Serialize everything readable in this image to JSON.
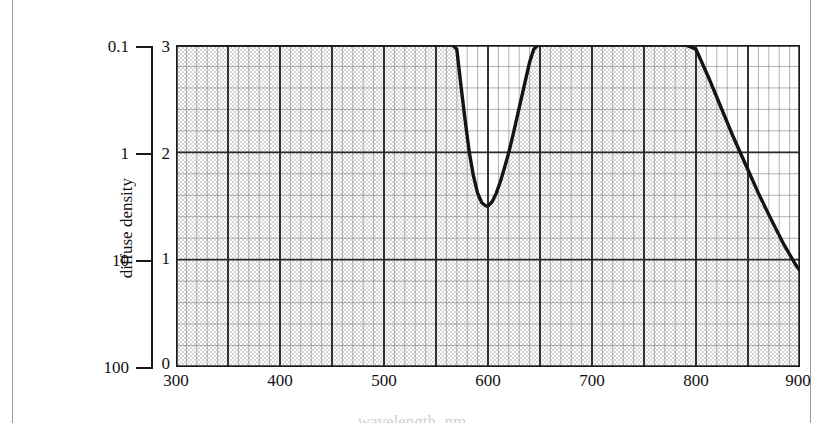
{
  "figure": {
    "background_color": "#ffffff",
    "ink_color": "#1a1a1a",
    "grid_minor_color": "#8c8c8c",
    "grid_major_color": "#262626",
    "stipple_color": "#b9b9b9"
  },
  "transmittance_axis": {
    "title": "transmittance, per cent",
    "ticks": [
      {
        "label": "0.1",
        "density": 3
      },
      {
        "label": "1",
        "density": 2
      },
      {
        "label": "10",
        "density": 1
      },
      {
        "label": "100",
        "density": 0
      }
    ]
  },
  "density_axis": {
    "title": "diffuse density",
    "ticks": [
      "3",
      "2",
      "1",
      "0"
    ]
  },
  "x_axis": {
    "title": "wavelength, nm",
    "ticks": [
      "300",
      "400",
      "500",
      "600",
      "700",
      "800",
      "900"
    ]
  },
  "chart_data": {
    "type": "line",
    "title": "",
    "subtitle": "",
    "xlabel": "wavelength, nm",
    "ylabel": "diffuse density",
    "y2label": "transmittance, per cent",
    "xlim": [
      300,
      900
    ],
    "ylim": [
      0,
      3
    ],
    "y2_ticks": [
      0.1,
      1,
      10,
      100
    ],
    "y2_tick_labels": [
      "0.1",
      "1",
      "10",
      "100"
    ],
    "xticks": [
      300,
      400,
      500,
      600,
      700,
      800,
      900
    ],
    "yticks": [
      0,
      1,
      2,
      3
    ],
    "x_minor_step": 10,
    "y_minor_step": 0.2,
    "grid": true,
    "grid_style": "stippled graph paper, major lines every 100 nm and 1.0 density",
    "legend": null,
    "annotations": [],
    "series": [
      {
        "name": "diffuse density vs wavelength",
        "line_color": "#1a1a1a",
        "line_width": 3,
        "clipped_above": 3,
        "x": [
          300,
          400,
          500,
          540,
          556,
          562,
          566,
          570,
          574,
          578,
          582,
          586,
          590,
          594,
          598,
          600,
          604,
          608,
          612,
          616,
          620,
          624,
          628,
          632,
          636,
          640,
          644,
          648,
          650,
          700,
          760,
          790,
          800,
          812,
          824,
          836,
          848,
          860,
          872,
          884,
          896,
          906
        ],
        "y": [
          3,
          3,
          3,
          3,
          3,
          3,
          3,
          2.96,
          2.62,
          2.3,
          2.0,
          1.78,
          1.62,
          1.53,
          1.5,
          1.5,
          1.54,
          1.62,
          1.73,
          1.86,
          2.0,
          2.16,
          2.33,
          2.5,
          2.67,
          2.84,
          2.96,
          3.0,
          3,
          3,
          3,
          3,
          2.96,
          2.7,
          2.42,
          2.14,
          1.88,
          1.62,
          1.38,
          1.15,
          0.95,
          0.82
        ]
      }
    ],
    "features": {
      "transmission_window_center_nm": 600,
      "transmission_window_min_density": 1.5,
      "transmission_window_range_nm": [
        566,
        648
      ],
      "ir_cutoff_onset_nm": 800,
      "density_at_900_nm": 0.87,
      "uv_visible_blocking_density": "> 3 (off scale) from 300 to 566 nm and 648 to 800 nm"
    }
  }
}
